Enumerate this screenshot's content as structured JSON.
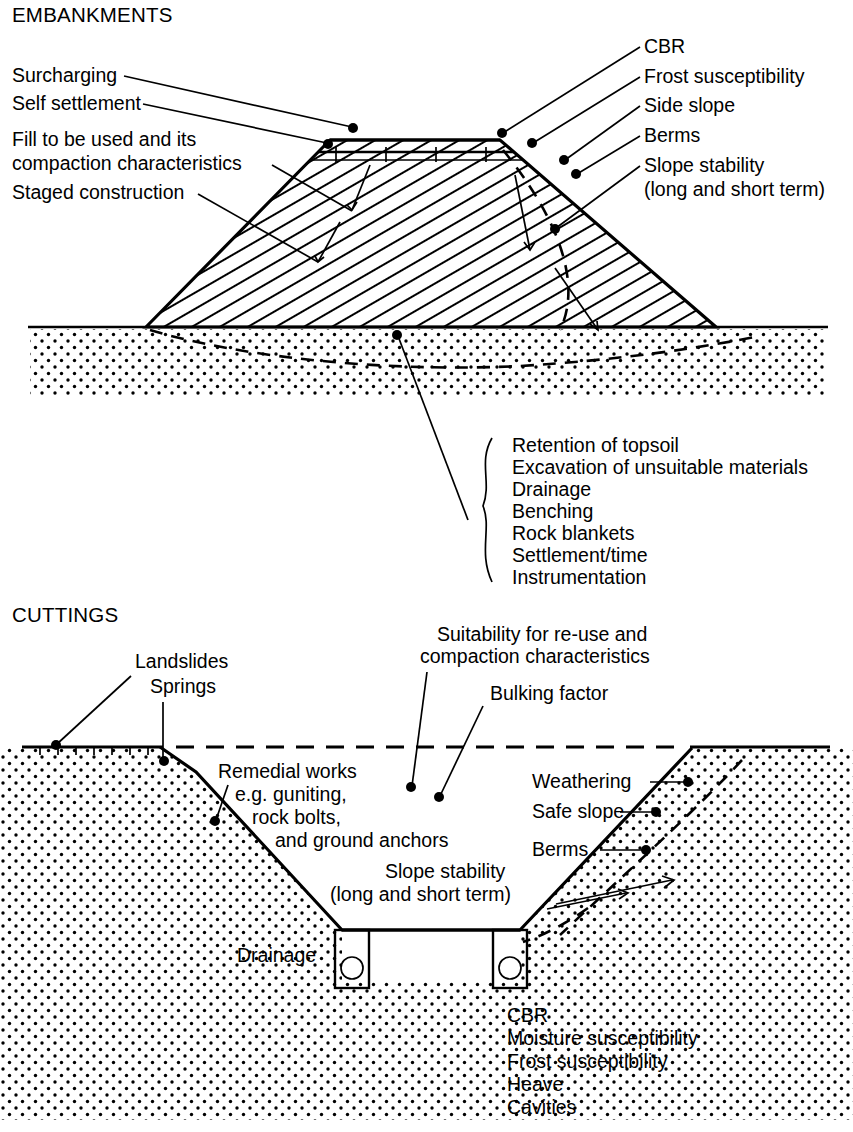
{
  "figure": {
    "sections": [
      {
        "id": "embankments",
        "title": "EMBANKMENTS",
        "left_labels": [
          {
            "id": "surcharging",
            "text": "Surcharging"
          },
          {
            "id": "self-settlement",
            "text": "Self settlement"
          },
          {
            "id": "fill-line-1",
            "text": "Fill to be used and its"
          },
          {
            "id": "fill-line-2",
            "text": "compaction characteristics"
          },
          {
            "id": "staged-construction",
            "text": "Staged construction"
          }
        ],
        "right_labels": [
          {
            "id": "cbr",
            "text": "CBR"
          },
          {
            "id": "frost-susceptibility",
            "text": "Frost susceptibility"
          },
          {
            "id": "side-slope",
            "text": "Side slope"
          },
          {
            "id": "berms",
            "text": "Berms"
          },
          {
            "id": "slope-stability-1",
            "text": "Slope stability"
          },
          {
            "id": "slope-stability-2",
            "text": "(long and short term)"
          }
        ],
        "foundation_list": [
          "Retention of topsoil",
          "Excavation of unsuitable materials",
          "Drainage",
          "Benching",
          "Rock blankets",
          "Settlement/time",
          "Instrumentation"
        ]
      },
      {
        "id": "cuttings",
        "title": "CUTTINGS",
        "top_labels": [
          {
            "id": "suitability-1",
            "text": "Suitability for re-use and"
          },
          {
            "id": "suitability-2",
            "text": "compaction characteristics"
          },
          {
            "id": "bulking-factor",
            "text": "Bulking factor"
          }
        ],
        "left_labels": [
          {
            "id": "landslides",
            "text": "Landslides"
          },
          {
            "id": "springs",
            "text": "Springs"
          }
        ],
        "remedial_labels": [
          {
            "id": "remedial-1",
            "text": "Remedial works"
          },
          {
            "id": "remedial-2",
            "text": "e.g. guniting,"
          },
          {
            "id": "remedial-3",
            "text": "rock bolts,"
          },
          {
            "id": "remedial-4",
            "text": "and ground anchors"
          }
        ],
        "right_labels": [
          {
            "id": "weathering",
            "text": "Weathering"
          },
          {
            "id": "safe-slope",
            "text": "Safe slope"
          },
          {
            "id": "berms",
            "text": "Berms"
          }
        ],
        "slope_stability": [
          {
            "id": "slope-stability-1",
            "text": "Slope stability"
          },
          {
            "id": "slope-stability-2",
            "text": "(long and short term)"
          }
        ],
        "drainage_label": {
          "id": "drainage",
          "text": "Drainage"
        },
        "formation_list": [
          "CBR",
          "Moisture susceptibility",
          "Frost susceptibility",
          "Heave",
          "Cavities"
        ]
      }
    ],
    "colors": {
      "ink": "#000000",
      "paper": "#ffffff"
    }
  }
}
